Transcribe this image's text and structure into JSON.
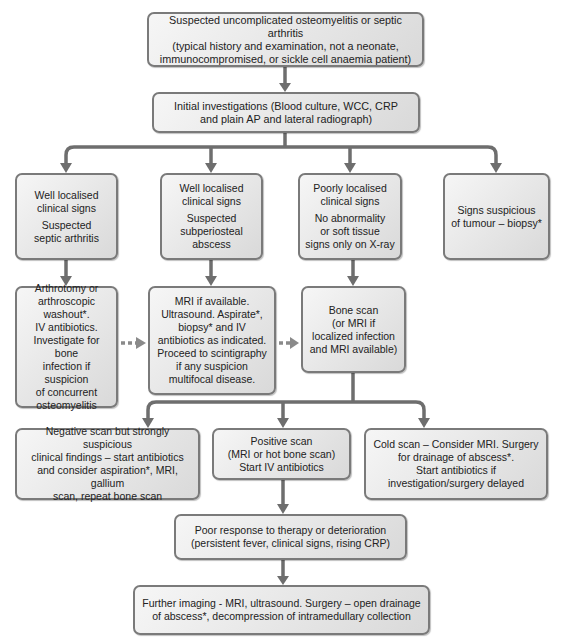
{
  "diagram": {
    "nodes": {
      "start": "Suspected uncomplicated osteomyelitis or septic arthritis\n(typical history and examination, not a neonate,\nimmunocompromised, or sickle cell anaemia patient)",
      "initial": "Initial investigations (Blood culture, WCC, CRP\nand plain AP and lateral radiograph)",
      "branch_septic_a": "Well localised\nclinical signs",
      "branch_septic_b": "Suspected\nseptic arthritis",
      "branch_subperiosteal_a": "Well localised\nclinical signs",
      "branch_subperiosteal_b": "Suspected\nsubperiosteal\nabscess",
      "branch_poorly_a": "Poorly localised\nclinical signs",
      "branch_poorly_b": "No abnormality\nor soft tissue\nsigns only on X-ray",
      "branch_tumour": "Signs suspicious\nof tumour – biopsy*",
      "arthrotomy": "Arthrotomy or\narthroscopic\nwashout*.\nIV antibiotics.\nInvestigate for bone\ninfection if suspicion\nof concurrent\nosteomyelitis",
      "mri": "MRI if available.\nUltrasound. Aspirate*,\nbiopsy* and IV\nantibiotics as indicated.\nProceed to scintigraphy\nif any suspicion\nmultifocal disease.",
      "bone_scan": "Bone scan\n(or MRI if\nlocalized infection\nand MRI available)",
      "negative_scan": "Negative scan but strongly suspicious\nclinical findings – start antibiotics\nand consider aspiration*, MRI, gallium\nscan, repeat bone scan",
      "positive_scan": "Positive scan\n(MRI or hot bone scan)\nStart  IV antibiotics",
      "cold_scan": "Cold scan – Consider MRI. Surgery\nfor drainage of abscess*.\nStart antibiotics if\ninvestigation/surgery delayed",
      "poor_response": "Poor response to therapy or deterioration\n(persistent  fever, clinical signs, rising CRP)",
      "further_imaging": "Further imaging - MRI, ultrasound. Surgery – open drainage\nof abscess*, decompression of intramedullary collection"
    },
    "colors": {
      "box_border": "#7a7a7a",
      "box_fill_light": "#f6f6f6",
      "box_fill_dark": "#d9d9d9",
      "connector": "#6e6e6e",
      "background": "#ffffff"
    }
  }
}
